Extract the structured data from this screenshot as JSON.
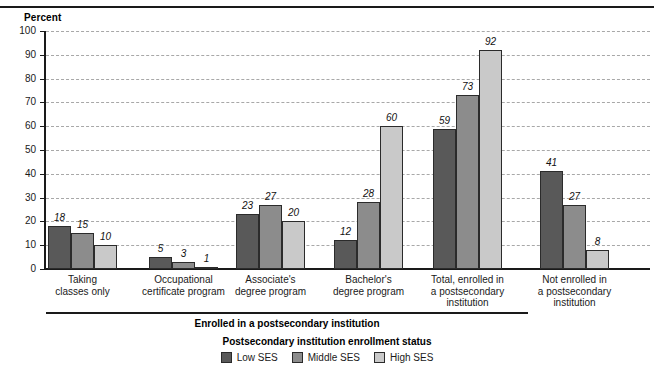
{
  "chart_data": {
    "type": "bar",
    "title": "",
    "ylabel": "Percent",
    "xlabel": "",
    "ylim": [
      0,
      100
    ],
    "ytick_step": 10,
    "ytick_labels": [
      "100",
      "90",
      "80",
      "70",
      "60",
      "50",
      "40",
      "30",
      "20",
      "10",
      "0"
    ],
    "grid": true,
    "legend_position": "bottom-center",
    "legend_title": "Postsecondary institution enrollment status",
    "categories": [
      "Taking\nclasses only",
      "Occupational\ncertificate program",
      "Associate's\ndegree program",
      "Bachelor's\ndegree program",
      "Total, enrolled in\na postsecondary\ninstitution",
      "Not enrolled in\na postsecondary\ninstitution"
    ],
    "category_lines": [
      [
        "Taking",
        "classes only"
      ],
      [
        "Occupational",
        "certificate program"
      ],
      [
        "Associate's",
        "degree program"
      ],
      [
        "Bachelor's",
        "degree program"
      ],
      [
        "Total, enrolled in",
        "a postsecondary",
        "institution"
      ],
      [
        "Not enrolled in",
        "a postsecondary",
        "institution"
      ]
    ],
    "series": [
      {
        "name": "Low SES",
        "color": "#595959",
        "values": [
          18,
          5,
          23,
          12,
          59,
          41
        ]
      },
      {
        "name": "Middle SES",
        "color": "#8c8c8c",
        "values": [
          15,
          3,
          27,
          28,
          73,
          27
        ]
      },
      {
        "name": "High SES",
        "color": "#c9c9c9",
        "values": [
          10,
          1,
          20,
          60,
          92,
          8
        ]
      }
    ],
    "group_bracket": {
      "label": "Enrolled in a postsecondary institution",
      "covers_categories": [
        0,
        1,
        2,
        3,
        4
      ]
    }
  }
}
